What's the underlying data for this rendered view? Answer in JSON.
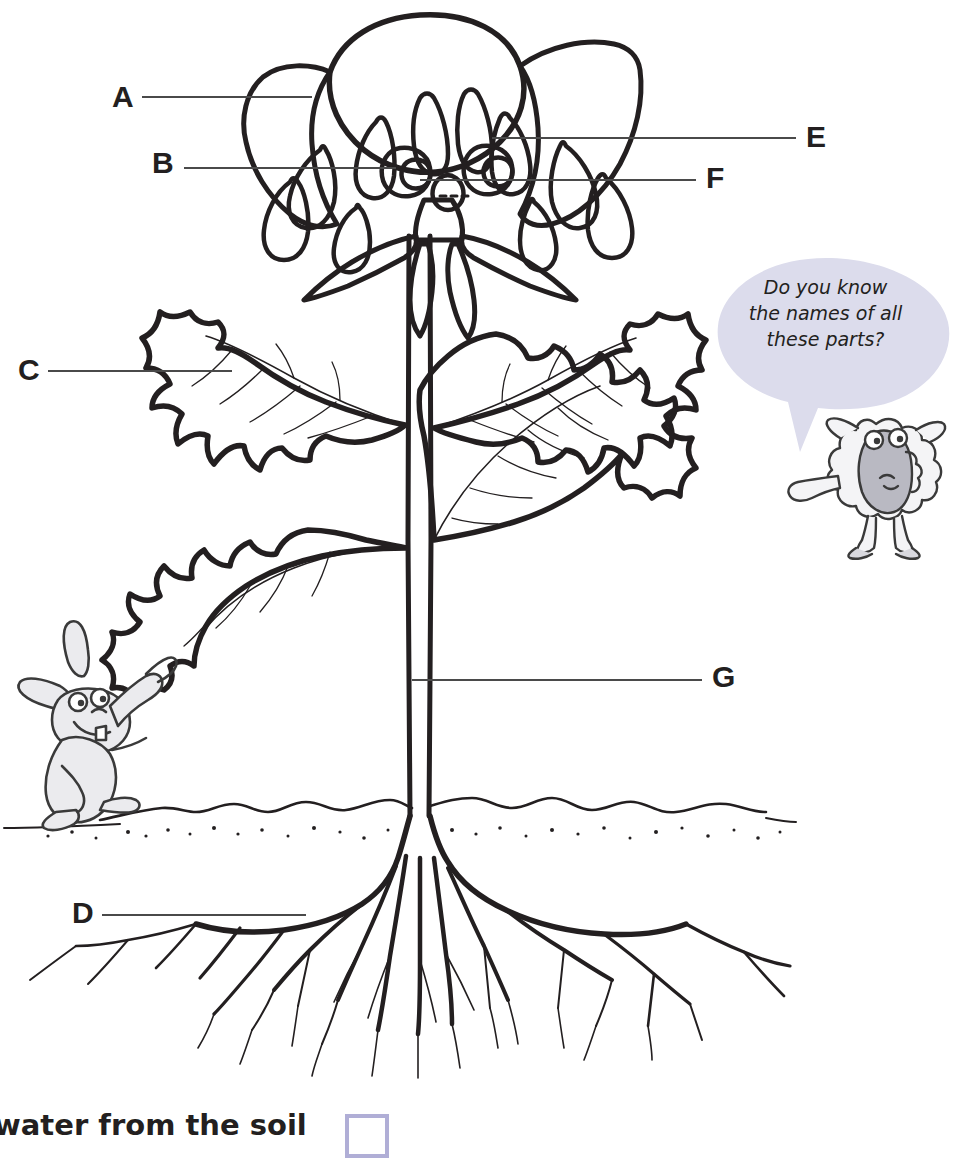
{
  "worksheet": {
    "title": "Plant parts labelling diagram",
    "subject": "Parts of a flowering plant"
  },
  "labels": [
    {
      "id": "A",
      "letter": "A",
      "points_to": "petal",
      "line_from_x": 140,
      "line_to_x": 310,
      "line_y": 97
    },
    {
      "id": "B",
      "letter": "B",
      "points_to": "stamen",
      "line_from_x": 182,
      "line_to_x": 392,
      "line_y": 168
    },
    {
      "id": "C",
      "letter": "C",
      "points_to": "leaf",
      "line_from_x": 46,
      "line_to_x": 228,
      "line_y": 371
    },
    {
      "id": "D",
      "letter": "D",
      "points_to": "root",
      "line_from_x": 100,
      "line_to_x": 302,
      "line_y": 915
    },
    {
      "id": "E",
      "letter": "E",
      "points_to": "carpel",
      "line_from_x": 598,
      "line_to_x": 793,
      "line_y": 138
    },
    {
      "id": "F",
      "letter": "F",
      "points_to": "sepal",
      "line_from_x": 430,
      "line_to_x": 694,
      "line_y": 180
    },
    {
      "id": "G",
      "letter": "G",
      "points_to": "stem",
      "line_from_x": 424,
      "line_to_x": 700,
      "line_y": 680
    }
  ],
  "speech_bubble": {
    "speaker": "sheep",
    "lines": [
      "Do you know",
      "the names of all",
      "these parts?"
    ],
    "fill_color": "#dcdcec",
    "text_color": "#231f20"
  },
  "characters": [
    {
      "name": "rabbit",
      "action": "holding a leaf",
      "x": 10,
      "y": 650
    },
    {
      "name": "sheep",
      "action": "pointing at the plant",
      "x": 840,
      "y": 412
    }
  ],
  "diagram": {
    "parts": [
      "petals",
      "stamens",
      "carpels",
      "sepals",
      "leaves",
      "stem",
      "roots",
      "soil line"
    ],
    "line_color": "#231f20",
    "soil_line_y": 815
  },
  "caption": {
    "text": "water from the soil",
    "checkbox_color": "#b0aed6",
    "checkbox_checked": false
  }
}
